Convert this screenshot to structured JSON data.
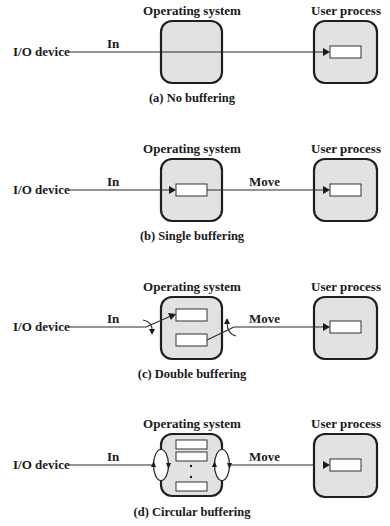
{
  "figure": {
    "panels": [
      {
        "id": "a",
        "caption": "(a) No buffering",
        "os_label": "Operating system",
        "user_label": "User process",
        "device_label": "I/O device",
        "in_label": "In",
        "move_label": "",
        "os_buffers": 0,
        "user_buffers": 1,
        "scheme": "none"
      },
      {
        "id": "b",
        "caption": "(b) Single buffering",
        "os_label": "Operating system",
        "user_label": "User process",
        "device_label": "I/O device",
        "in_label": "In",
        "move_label": "Move",
        "os_buffers": 1,
        "user_buffers": 1,
        "scheme": "single"
      },
      {
        "id": "c",
        "caption": "(c) Double buffering",
        "os_label": "Operating system",
        "user_label": "User process",
        "device_label": "I/O device",
        "in_label": "In",
        "move_label": "Move",
        "os_buffers": 2,
        "user_buffers": 1,
        "scheme": "double"
      },
      {
        "id": "d",
        "caption": "(d) Circular buffering",
        "os_label": "Operating system",
        "user_label": "User process",
        "device_label": "I/O device",
        "in_label": "In",
        "move_label": "Move",
        "os_buffers": "n (circular)",
        "user_buffers": 1,
        "scheme": "circular"
      }
    ],
    "colors": {
      "box_fill": "#e2e2e2",
      "box_stroke": "#1f1f1f",
      "buffer_fill": "#ffffff",
      "text": "#1a1a1a"
    }
  }
}
